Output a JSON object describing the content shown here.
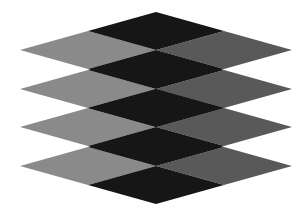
{
  "figure": {
    "type": "illusion-stacked-rhombi",
    "width": 306,
    "height": 218,
    "background": "#ffffff",
    "center_x": 156,
    "left_x": 20,
    "right_x": 292,
    "half_height": 38,
    "layers": [
      {
        "center_y": 50
      },
      {
        "center_y": 89
      },
      {
        "center_y": 127
      },
      {
        "center_y": 166
      }
    ],
    "colors": {
      "top": "#161616",
      "bottom": "#161616",
      "left": "#8a8a8a",
      "right": "#595959"
    }
  }
}
